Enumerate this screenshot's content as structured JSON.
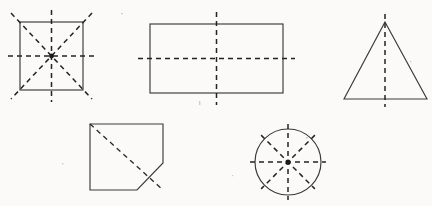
{
  "page": {
    "background_color": "#fbfaf8",
    "outline_color": "#3a3a3c",
    "axis_color": "#232325",
    "width": 432,
    "height": 206
  },
  "figures": [
    {
      "id": "square",
      "name": "Square",
      "lines_of_symmetry": 4,
      "axis_types": [
        "vertical",
        "horizontal",
        "diagonal",
        "diagonal"
      ],
      "bounds": {
        "x": 20,
        "y": 22,
        "width": 63,
        "height": 68
      },
      "center": {
        "x": 51.5,
        "y": 56
      },
      "has_center_dot": true
    },
    {
      "id": "rectangle",
      "name": "Rectangle",
      "lines_of_symmetry": 2,
      "axis_types": [
        "vertical",
        "horizontal"
      ],
      "bounds": {
        "x": 150,
        "y": 24,
        "width": 133,
        "height": 69
      },
      "center": {
        "x": 216.5,
        "y": 58.5
      },
      "has_center_dot": false
    },
    {
      "id": "triangle",
      "name": "Isosceles Triangle",
      "lines_of_symmetry": 1,
      "axis_types": [
        "vertical"
      ],
      "apex": {
        "x": 385,
        "y": 22
      },
      "base_left": {
        "x": 344,
        "y": 99
      },
      "base_right": {
        "x": 427,
        "y": 99
      },
      "has_center_dot": false
    },
    {
      "id": "pentagon",
      "name": "Cut-Corner Pentagon",
      "lines_of_symmetry": 1,
      "axis_types": [
        "diagonal"
      ],
      "vertices": [
        {
          "x": 90,
          "y": 124
        },
        {
          "x": 163,
          "y": 124
        },
        {
          "x": 163,
          "y": 163
        },
        {
          "x": 137,
          "y": 190
        },
        {
          "x": 90,
          "y": 190
        }
      ],
      "has_center_dot": false
    },
    {
      "id": "circle",
      "name": "Circle",
      "lines_of_symmetry": 4,
      "axis_types": [
        "vertical",
        "horizontal",
        "diagonal",
        "diagonal"
      ],
      "center": {
        "x": 288,
        "y": 162
      },
      "radius": 33,
      "has_center_dot": true
    }
  ]
}
